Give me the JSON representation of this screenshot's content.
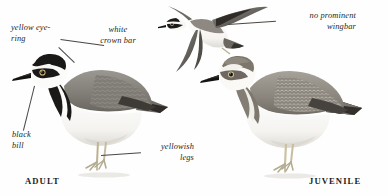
{
  "plate": {
    "subject": "ringed-plover-field-guide-plate",
    "background": "#ffffff",
    "ink": "#231f1c"
  },
  "annotations": [
    {
      "id": "yellow-eye-ring",
      "text": "yellow eye-\nring",
      "align": "left"
    },
    {
      "id": "white-crown-bar",
      "text": "white\ncrown bar",
      "align": "center"
    },
    {
      "id": "no-wingbar",
      "text": "no prominent\nwingbar",
      "align": "right"
    },
    {
      "id": "black-bill",
      "text": "black\nbill",
      "align": "left"
    },
    {
      "id": "yellowish-legs",
      "text": "yellowish\nlegs",
      "align": "right"
    }
  ],
  "stage_labels": [
    {
      "id": "adult",
      "text": "ADULT"
    },
    {
      "id": "juvenile",
      "text": "JUVENILE"
    }
  ],
  "figures": [
    {
      "id": "adult-plover-standing",
      "pose": "standing, side view, facing left"
    },
    {
      "id": "plover-in-flight",
      "pose": "flying, upperwing view, facing left"
    },
    {
      "id": "juvenile-plover-standing",
      "pose": "standing, side view, facing left"
    }
  ],
  "colors": {
    "mantle_grey": "#8d8a84",
    "mantle_dark": "#5d5a55",
    "black_mask": "#1c1a18",
    "white": "#fbfbf9",
    "leg_yellow": "#cfc6a8",
    "shadow": "#bdb9b2"
  }
}
